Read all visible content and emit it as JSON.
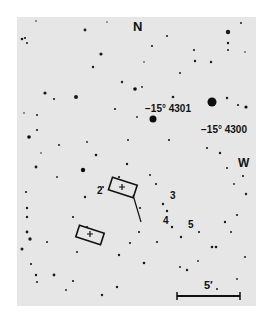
{
  "figure": {
    "compass": {
      "north": "N",
      "west": "W"
    },
    "stars": [
      {
        "label": "−15° 4301"
      },
      {
        "label": "−15° 4300"
      }
    ],
    "field_markers": [
      "2",
      "3",
      "4",
      "5"
    ],
    "scale_bar": {
      "label": "5′"
    },
    "colors": {
      "background": "#e6e6e6",
      "ink": "#111111"
    }
  }
}
